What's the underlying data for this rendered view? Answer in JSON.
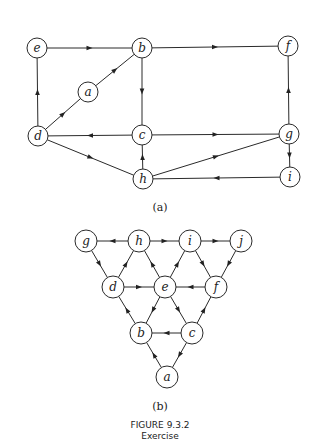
{
  "figure": {
    "title": "FIGURE 9.3.2",
    "subtitle": "Exercise"
  },
  "graphs": [
    {
      "id": "a",
      "label": "(a)",
      "label_pos": [
        160,
        211
      ],
      "radius": 10,
      "nodes": [
        {
          "id": "e",
          "x": 37,
          "y": 48
        },
        {
          "id": "b",
          "x": 142,
          "y": 48
        },
        {
          "id": "f",
          "x": 288,
          "y": 46
        },
        {
          "id": "a",
          "x": 88,
          "y": 92
        },
        {
          "id": "d",
          "x": 38,
          "y": 136
        },
        {
          "id": "c",
          "x": 142,
          "y": 135
        },
        {
          "id": "g",
          "x": 289,
          "y": 134
        },
        {
          "id": "h",
          "x": 143,
          "y": 179
        },
        {
          "id": "i",
          "x": 290,
          "y": 177
        }
      ],
      "edges": [
        [
          "e",
          "b"
        ],
        [
          "b",
          "f"
        ],
        [
          "a",
          "b"
        ],
        [
          "d",
          "a"
        ],
        [
          "d",
          "e"
        ],
        [
          "b",
          "c"
        ],
        [
          "c",
          "d"
        ],
        [
          "c",
          "g"
        ],
        [
          "d",
          "h"
        ],
        [
          "h",
          "c"
        ],
        [
          "h",
          "g"
        ],
        [
          "g",
          "f"
        ],
        [
          "g",
          "i"
        ],
        [
          "i",
          "h"
        ]
      ]
    },
    {
      "id": "b",
      "label": "(b)",
      "label_pos": [
        160,
        410
      ],
      "radius": 11,
      "nodes": [
        {
          "id": "g",
          "x": 86,
          "y": 241
        },
        {
          "id": "h",
          "x": 139,
          "y": 241
        },
        {
          "id": "i",
          "x": 190,
          "y": 241
        },
        {
          "id": "j",
          "x": 241,
          "y": 241
        },
        {
          "id": "d",
          "x": 113,
          "y": 287
        },
        {
          "id": "e",
          "x": 165,
          "y": 287
        },
        {
          "id": "f",
          "x": 216,
          "y": 287
        },
        {
          "id": "b",
          "x": 141,
          "y": 333
        },
        {
          "id": "c",
          "x": 192,
          "y": 333
        },
        {
          "id": "a",
          "x": 167,
          "y": 377
        }
      ],
      "edges": [
        [
          "h",
          "g"
        ],
        [
          "h",
          "i"
        ],
        [
          "i",
          "j"
        ],
        [
          "g",
          "d"
        ],
        [
          "d",
          "h"
        ],
        [
          "e",
          "h"
        ],
        [
          "e",
          "i"
        ],
        [
          "i",
          "f"
        ],
        [
          "j",
          "f"
        ],
        [
          "d",
          "e"
        ],
        [
          "f",
          "e"
        ],
        [
          "b",
          "d"
        ],
        [
          "e",
          "b"
        ],
        [
          "e",
          "c"
        ],
        [
          "c",
          "f"
        ],
        [
          "c",
          "b"
        ],
        [
          "a",
          "b"
        ],
        [
          "c",
          "a"
        ]
      ]
    }
  ]
}
